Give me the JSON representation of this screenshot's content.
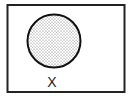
{
  "diagram": {
    "type": "venn",
    "universal_set": {
      "label": ""
    },
    "sets": [
      {
        "label": "X",
        "shaded": true,
        "shading": "stipple"
      }
    ],
    "colors": {
      "stroke": "#222222",
      "background": "#ffffff",
      "shading_dots": "#555555"
    }
  }
}
